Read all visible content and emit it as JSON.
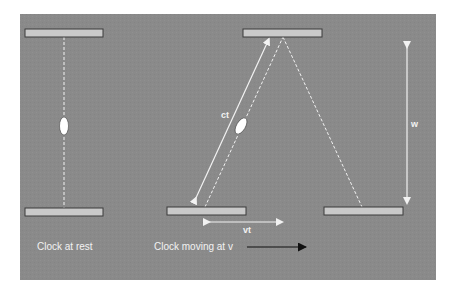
{
  "diagram": {
    "type": "light-clock time dilation",
    "colors": {
      "page_background": "#ffffff",
      "panel_background": "#8a8a8a",
      "mirror_fill": "#c9c9c9",
      "mirror_stroke": "#3a3a3a",
      "light_path": "#f2f2f2",
      "motion_arrow": "#111111"
    },
    "panel": {
      "x": 20,
      "y": 14,
      "width": 416,
      "height": 266
    },
    "mirrors": [
      {
        "id": "rest-top",
        "x": 25,
        "y": 29,
        "width": 78,
        "height": 8
      },
      {
        "id": "rest-bottom",
        "x": 25,
        "y": 208,
        "width": 78,
        "height": 8
      },
      {
        "id": "moving-top",
        "x": 243,
        "y": 29,
        "width": 79,
        "height": 8
      },
      {
        "id": "moving-bottom-start",
        "x": 167,
        "y": 207,
        "width": 79,
        "height": 8
      },
      {
        "id": "moving-bottom-end",
        "x": 324,
        "y": 207,
        "width": 79,
        "height": 8
      }
    ],
    "photons": [
      {
        "id": "rest-photon",
        "cx": 64,
        "cy": 126,
        "rx": 4.5,
        "ry": 9,
        "rotate": 0
      },
      {
        "id": "moving-photon",
        "cx": 241,
        "cy": 126,
        "rx": 4.5,
        "ry": 9,
        "rotate": 30
      }
    ],
    "labels": {
      "clock_rest": "Clock at rest",
      "clock_moving": "Clock moving at v",
      "ct": "ct",
      "vt": "vt",
      "w": "w"
    }
  }
}
